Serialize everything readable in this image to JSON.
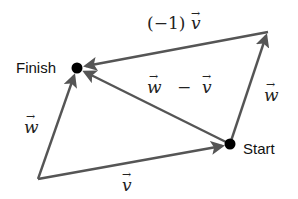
{
  "diagram": {
    "points": {
      "finish": {
        "label": "Finish",
        "x": 77,
        "y": 68
      },
      "start": {
        "label": "Start",
        "x": 230,
        "y": 144
      },
      "origin": {
        "x": 38,
        "y": 179
      },
      "top_right": {
        "x": 268,
        "y": 32
      }
    },
    "vectors": [
      {
        "id": "v-bottom",
        "label_var": "v",
        "label_prefix": "",
        "from": "origin",
        "to": "start"
      },
      {
        "id": "w-left",
        "label_var": "w",
        "label_prefix": "",
        "from": "origin",
        "to": "finish"
      },
      {
        "id": "w-right",
        "label_var": "w",
        "label_prefix": "",
        "from": "start",
        "to": "top_right"
      },
      {
        "id": "neg-v-top",
        "label_var": "v",
        "label_prefix": "(−1)",
        "from": "top_right",
        "to": "finish"
      },
      {
        "id": "w-minus-v",
        "label_var": "w − v",
        "label_prefix": "",
        "from": "start",
        "to": "finish"
      }
    ],
    "labels": {
      "finish": "Finish",
      "start": "Start",
      "neg_v_prefix": "(−1)",
      "neg_v_var": "v",
      "w_minus_v_w": "w",
      "w_minus_v_minus": "−",
      "w_minus_v_v": "v",
      "w_left": "w",
      "w_right": "w",
      "v_bottom": "v",
      "arrow_glyph": "→"
    },
    "colors": {
      "line": "#555555",
      "dot": "#000000",
      "text": "#222222"
    }
  }
}
